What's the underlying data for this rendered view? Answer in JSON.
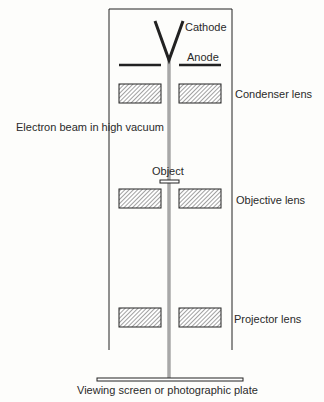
{
  "diagram": {
    "labels": {
      "cathode": "Cathode",
      "anode": "Anode",
      "condenser_lens": "Condenser lens",
      "electron_beam": "Electron beam in high vacuum",
      "object": "Object",
      "objective_lens": "Objective lens",
      "projector_lens": "Projector lens",
      "viewing_screen": "Viewing screen or photographic plate"
    },
    "colors": {
      "line": "#222222",
      "beam": "#a8a8a8",
      "background": "#fdfdfb"
    }
  }
}
